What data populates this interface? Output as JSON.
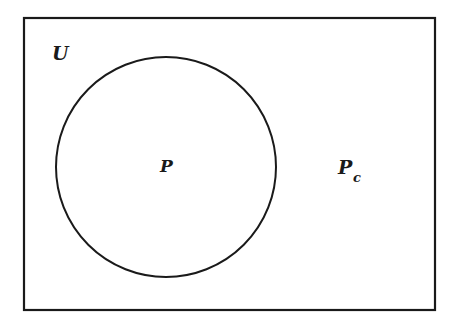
{
  "diagram": {
    "type": "venn",
    "universe_label": "U",
    "set_label": "P",
    "complement_label": "P",
    "complement_subscript": "c",
    "stroke_color": "#1a1a1a",
    "background": "#ffffff"
  }
}
